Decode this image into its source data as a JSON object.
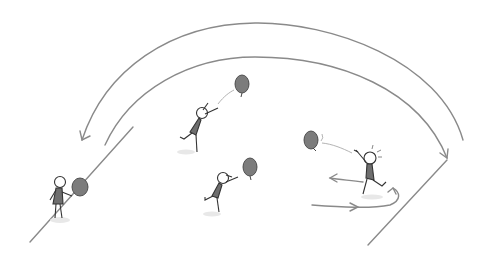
{
  "illustration": {
    "description": "Sketch of stick figures passing balloons along a curved path between two diagonal lines",
    "colors": {
      "line": "#8a8a8a",
      "stroke": "#333333",
      "balloon": "#7a7a7a",
      "body": "#6e6e6e",
      "shadow": "#e6e6e6"
    },
    "figures": [
      {
        "id": "left-player",
        "role": "holding balloon",
        "x": 60,
        "y": 195
      },
      {
        "id": "upper-middle-player",
        "role": "reaching for balloon",
        "x": 200,
        "y": 118
      },
      {
        "id": "lower-middle-player",
        "role": "reaching for balloon",
        "x": 220,
        "y": 185
      },
      {
        "id": "right-player",
        "role": "throwing balloon",
        "x": 370,
        "y": 162
      }
    ],
    "balloons": [
      {
        "id": "balloon-left",
        "x": 80,
        "y": 188
      },
      {
        "id": "balloon-upper",
        "x": 242,
        "y": 84
      },
      {
        "id": "balloon-lower",
        "x": 250,
        "y": 167
      },
      {
        "id": "balloon-right",
        "x": 311,
        "y": 140
      }
    ]
  }
}
